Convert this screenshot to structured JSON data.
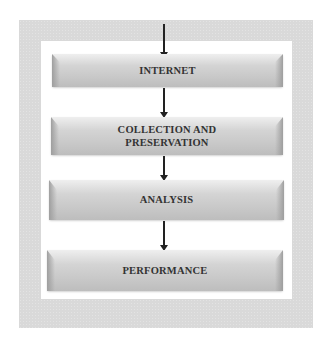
{
  "diagram": {
    "type": "vertical-flowchart",
    "steps": [
      {
        "label": "INTERNET"
      },
      {
        "label": "COLLECTION AND PRESERVATION",
        "lines": [
          "COLLECTION AND",
          "PRESERVATION"
        ]
      },
      {
        "label": "ANALYSIS"
      },
      {
        "label": "PERFORMANCE"
      }
    ],
    "arrows": [
      {
        "from": "top",
        "to": "INTERNET"
      },
      {
        "from": "INTERNET",
        "to": "COLLECTION AND PRESERVATION"
      },
      {
        "from": "COLLECTION AND PRESERVATION",
        "to": "ANALYSIS"
      },
      {
        "from": "ANALYSIS",
        "to": "PERFORMANCE"
      }
    ],
    "colors": {
      "frame": "#d9d9d9",
      "box": "#c8c8c8",
      "text": "#333333",
      "arrow": "#222222"
    }
  }
}
